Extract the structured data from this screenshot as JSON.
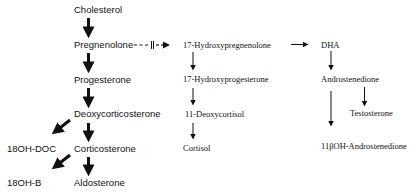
{
  "diagram": {
    "type": "steroid-biosynthesis-pathway",
    "nodes": {
      "cholesterol": "Cholesterol",
      "pregnenolone": "Pregnenolone",
      "progesterone": "Progesterone",
      "deoxycorticosterone": "Deoxycorticosterone",
      "corticosterone": "Corticosterone",
      "aldosterone": "Aldosterone",
      "oh18_doc": "18OH-DOC",
      "oh18_b": "18OH-B",
      "hydroxypregnenolone17": "17-Hydroxypregnenolone",
      "hydroxyprogesterone17": "17-Hydroxyprogesterone",
      "deoxycortisol11": "11-Deoxycortisol",
      "cortisol": "Cortisol",
      "dha": "DHA",
      "androstenedione": "Androstenedione",
      "testosterone": "Testosterone",
      "oh_androstenedione11b": "11βOH-Androstenedione"
    },
    "blocked_marker": "II",
    "edges": [
      {
        "from": "Cholesterol",
        "to": "Pregnenolone",
        "style": "bold"
      },
      {
        "from": "Pregnenolone",
        "to": "Progesterone",
        "style": "bold"
      },
      {
        "from": "Progesterone",
        "to": "Deoxycorticosterone",
        "style": "bold"
      },
      {
        "from": "Deoxycorticosterone",
        "to": "Corticosterone",
        "style": "bold"
      },
      {
        "from": "Corticosterone",
        "to": "Aldosterone",
        "style": "bold"
      },
      {
        "from": "Deoxycorticosterone",
        "to": "18OH-DOC",
        "style": "bold"
      },
      {
        "from": "Corticosterone",
        "to": "18OH-B",
        "style": "bold"
      },
      {
        "from": "Pregnenolone",
        "to": "17-Hydroxypregnenolone",
        "style": "dashed-blocked"
      },
      {
        "from": "17-Hydroxypregnenolone",
        "to": "17-Hydroxyprogesterone",
        "style": "thin"
      },
      {
        "from": "17-Hydroxyprogesterone",
        "to": "11-Deoxycortisol",
        "style": "thin"
      },
      {
        "from": "11-Deoxycortisol",
        "to": "Cortisol",
        "style": "thin"
      },
      {
        "from": "17-Hydroxypregnenolone",
        "to": "DHA",
        "style": "thin"
      },
      {
        "from": "DHA",
        "to": "Androstenedione",
        "style": "thin"
      },
      {
        "from": "Androstenedione",
        "to": "Testosterone",
        "style": "thin"
      },
      {
        "from": "Androstenedione",
        "to": "11βOH-Androstenedione",
        "style": "thin"
      }
    ]
  }
}
